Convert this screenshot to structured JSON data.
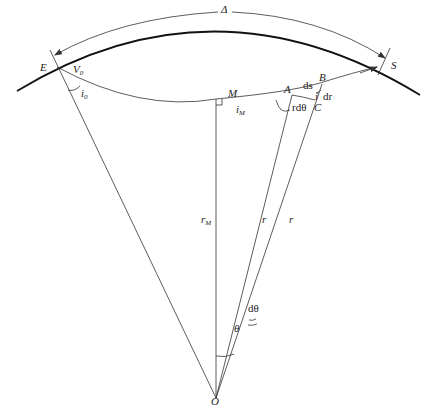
{
  "diagram": {
    "type": "seismic-ray-geometry",
    "labels": {
      "delta": "Δ",
      "E": "E",
      "S": "S",
      "V0": "V",
      "V0_sub": "0",
      "i0": "i",
      "i0_sub": "0",
      "M": "M",
      "iM": "i",
      "iM_sub": "M",
      "A": "A",
      "B": "B",
      "C": "C",
      "ds": "ds",
      "dr": "dr",
      "i": "i",
      "rdtheta": "rdθ",
      "rM": "r",
      "rM_sub": "M",
      "r1": "r",
      "r2": "r",
      "dtheta": "dθ",
      "theta": "θ",
      "O": "O"
    },
    "colors": {
      "line": "#333333",
      "surface": "#111111",
      "background": "#ffffff"
    }
  }
}
